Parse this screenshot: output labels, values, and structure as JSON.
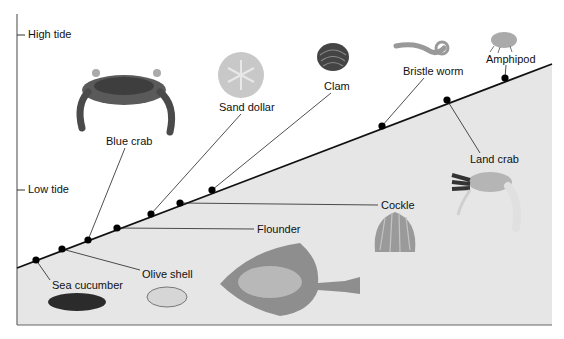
{
  "axis": {
    "high_tide_label": "High tide",
    "low_tide_label": "Low tide"
  },
  "organisms": [
    {
      "name": "Sea cucumber",
      "dot": [
        36,
        260
      ],
      "label_pos": [
        52,
        279
      ]
    },
    {
      "name": "Olive shell",
      "dot": [
        62,
        249
      ],
      "label_pos": [
        142,
        269
      ]
    },
    {
      "name": "Blue crab",
      "dot": [
        88,
        240
      ],
      "label_pos": [
        106,
        135
      ]
    },
    {
      "name": "Flounder",
      "dot": [
        117,
        228
      ],
      "label_pos": [
        256,
        223
      ]
    },
    {
      "name": "Sand dollar",
      "dot": [
        151,
        214
      ],
      "label_pos": [
        218,
        101
      ]
    },
    {
      "name": "Cockle",
      "dot": [
        180,
        203
      ],
      "label_pos": [
        381,
        200
      ]
    },
    {
      "name": "Clam",
      "dot": [
        212,
        190
      ],
      "label_pos": [
        324,
        80
      ]
    },
    {
      "name": "Bristle worm",
      "dot": [
        382,
        126
      ],
      "label_pos": [
        403,
        65
      ]
    },
    {
      "name": "Land crab",
      "dot": [
        447,
        100
      ],
      "label_pos": [
        469,
        154
      ]
    },
    {
      "name": "Amphipod",
      "dot": [
        505,
        78
      ],
      "label_pos": [
        485,
        53
      ]
    }
  ],
  "colors": {
    "shore_fill": "#e6e6e6",
    "line": "#111111",
    "axis": "#555555"
  }
}
